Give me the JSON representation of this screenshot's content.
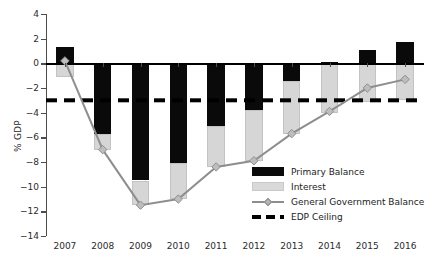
{
  "chart_data": {
    "type": "bar",
    "title": "",
    "xlabel": "",
    "ylabel": "% GDP",
    "ylim": [
      -14,
      4
    ],
    "yticks": [
      4,
      2,
      0,
      -2,
      -4,
      -6,
      -8,
      -10,
      -12,
      -14
    ],
    "ytick_labels": [
      "4",
      "2",
      "0",
      "-2",
      "-4",
      "-6",
      "-8",
      "-10",
      "-12",
      "-14"
    ],
    "grid": false,
    "legend_position": "inside-lower-right",
    "stacked": true,
    "categories": [
      "2007",
      "2008",
      "2009",
      "2010",
      "2011",
      "2012",
      "2013",
      "2014",
      "2015",
      "2016"
    ],
    "series": [
      {
        "name": "Primary Balance",
        "kind": "bar",
        "color": "#0a0a0a",
        "values": [
          1.3,
          -5.7,
          -9.5,
          -8.1,
          -5.1,
          -3.8,
          -1.4,
          0.1,
          1.1,
          1.7
        ]
      },
      {
        "name": "Interest",
        "kind": "bar",
        "color": "#d6d6d6",
        "values": [
          -1.1,
          -1.3,
          -2.0,
          -2.9,
          -3.3,
          -4.1,
          -4.3,
          -4.0,
          -3.1,
          -3.0
        ]
      },
      {
        "name": "General Government Balance",
        "kind": "line",
        "color": "#8e8e8e",
        "marker": "diamond",
        "values": [
          0.2,
          -7.0,
          -11.5,
          -11.0,
          -8.4,
          -7.9,
          -5.7,
          -3.9,
          -2.0,
          -1.3
        ]
      },
      {
        "name": "EDP Ceiling",
        "kind": "hline",
        "color": "#000000",
        "style": "dashed",
        "value": -3
      }
    ],
    "annotations": []
  },
  "legend": {
    "items": [
      {
        "label": "Primary Balance",
        "swatch": "primary-balance-swatch"
      },
      {
        "label": "Interest",
        "swatch": "interest-swatch"
      },
      {
        "label": "General Government Balance",
        "swatch": "general-government-balance-swatch"
      },
      {
        "label": "EDP Ceiling",
        "swatch": "edp-ceiling-swatch"
      }
    ]
  }
}
